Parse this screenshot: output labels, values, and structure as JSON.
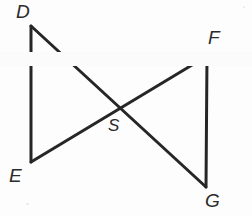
{
  "figure": {
    "background_color": "#fdfdfd",
    "stroke_color": "#262626",
    "label_color": "#2b2b2b",
    "stroke_width": 3,
    "width": 252,
    "height": 216
  },
  "labels": {
    "d": "D",
    "e": "E",
    "f": "F",
    "g": "G",
    "s": "S"
  },
  "points": {
    "D": {
      "x": 31,
      "y": 26
    },
    "E": {
      "x": 31,
      "y": 162
    },
    "F": {
      "x": 207,
      "y": 56
    },
    "G": {
      "x": 206,
      "y": 187
    },
    "S": {
      "x": 119,
      "y": 108
    }
  },
  "segments": [
    {
      "name": "DE",
      "from": "D",
      "to": "E"
    },
    {
      "name": "DG",
      "from": "D",
      "to": "G"
    },
    {
      "name": "EF",
      "from": "E",
      "to": "F"
    },
    {
      "name": "FG",
      "from": "F",
      "to": "G"
    }
  ],
  "label_positions": {
    "d": {
      "left": 16,
      "top": 2
    },
    "e": {
      "left": 9,
      "top": 166
    },
    "f": {
      "left": 208,
      "top": 28
    },
    "g": {
      "left": 205,
      "top": 191
    },
    "s": {
      "left": 108,
      "top": 117
    }
  }
}
